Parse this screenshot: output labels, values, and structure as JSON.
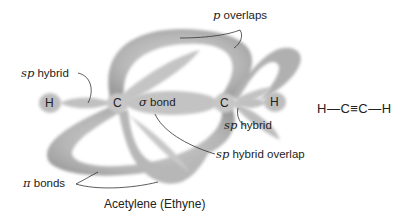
{
  "title": "Acetylene (Ethyne)",
  "atoms": {
    "h_left": "H",
    "c_left": "C",
    "c_right": "C",
    "h_right": "H"
  },
  "labels": {
    "p_overlaps": {
      "symbol": "p",
      "text": "overlaps"
    },
    "sp_hybrid_left": {
      "symbol": "sp",
      "text": "hybrid"
    },
    "sp_hybrid_right": {
      "symbol": "sp",
      "text": "hybrid"
    },
    "sigma_bond": {
      "symbol": "σ",
      "text": "bond"
    },
    "sp_hybrid_overlap": {
      "symbol": "sp",
      "text": "hybrid overlap"
    },
    "pi_bonds": {
      "symbol": "π",
      "text": "bonds"
    }
  },
  "structural_formula": "H—C≡C—H",
  "colors": {
    "lobe": "#b8b8b8",
    "lobe_dark": "#9a9a9a",
    "text": "#222222",
    "leader_line": "#333333"
  }
}
